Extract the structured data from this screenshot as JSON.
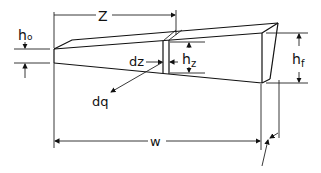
{
  "figure": {
    "type": "tapered fin / wedge schematic",
    "labels": {
      "z": "Z",
      "h0_main": "h",
      "h0_sub": "o",
      "dz": "dz",
      "hz_main": "h",
      "hz_sub": "z",
      "hf_main": "h",
      "hf_sub": "f",
      "dq": "dq",
      "w": "w"
    },
    "colors": {
      "line": "#111111",
      "background": "#ffffff"
    }
  }
}
